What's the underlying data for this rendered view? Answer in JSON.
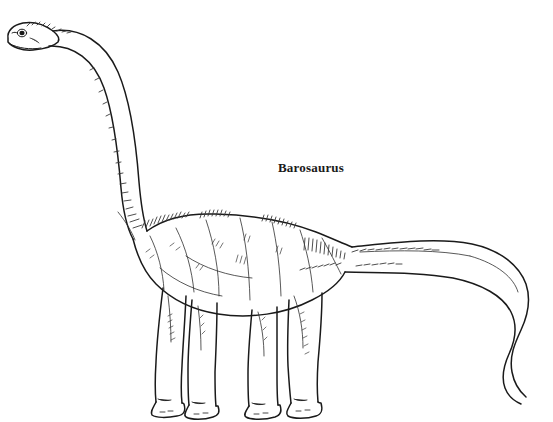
{
  "image": {
    "kind": "scientific-line-illustration",
    "subject_label": "Barosaurus",
    "background_color": "#ffffff",
    "ink_color": "#1a1a1a",
    "hatch_color": "#3a3a3a",
    "width": 553,
    "height": 422
  },
  "caption": {
    "text": "Barosaurus",
    "x": 278,
    "y": 161,
    "font_size": 13,
    "weight": "bold",
    "color": "#1a1a1a"
  },
  "anatomy": {
    "parts": [
      {
        "name": "head",
        "label": "Head"
      },
      {
        "name": "eye",
        "label": "Eye"
      },
      {
        "name": "nostril",
        "label": "Nostril"
      },
      {
        "name": "neck",
        "label": "Neck"
      },
      {
        "name": "shoulder",
        "label": "Shoulder"
      },
      {
        "name": "back",
        "label": "Back"
      },
      {
        "name": "body",
        "label": "Body"
      },
      {
        "name": "hip",
        "label": "Hip"
      },
      {
        "name": "tail",
        "label": "Tail"
      },
      {
        "name": "tail-tip",
        "label": "Whip tail tip"
      },
      {
        "name": "front-left-leg",
        "label": "Front left leg"
      },
      {
        "name": "front-right-leg",
        "label": "Front right leg"
      },
      {
        "name": "hind-left-leg",
        "label": "Hind left leg"
      },
      {
        "name": "hind-right-leg",
        "label": "Hind right leg"
      },
      {
        "name": "foot",
        "label": "Foot"
      }
    ]
  }
}
